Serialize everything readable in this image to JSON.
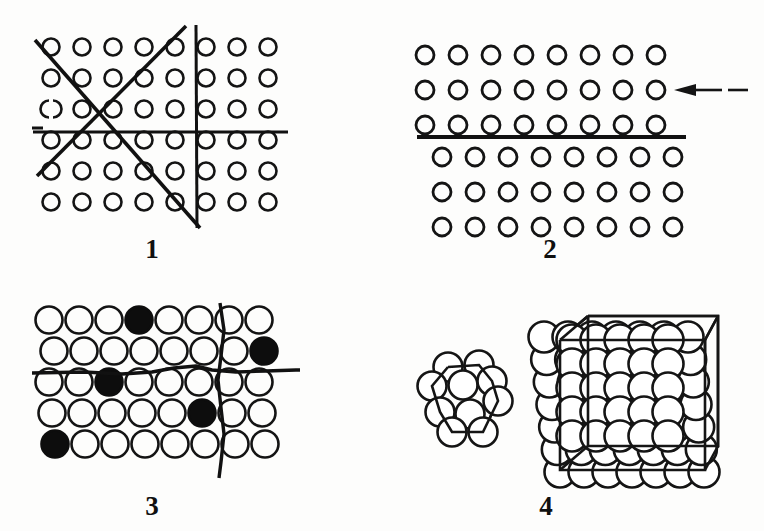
{
  "figure": {
    "background_color": "#fdfdfc",
    "ink_color": "#141414",
    "panels": [
      {
        "id": "panel-1",
        "caption": "1",
        "caption_x": 152,
        "caption_y": 236,
        "description": "Square lattice of open circles crossed by horizontal, vertical and two diagonal slip lines",
        "lattice": {
          "type": "square-open",
          "rows": 6,
          "cols": 8,
          "origin_x": 51,
          "origin_y": 47,
          "dx": 31,
          "dy": 31,
          "radius": 8.5,
          "stroke_width": 2.6,
          "broken_circle": {
            "row": 2,
            "col": 0
          }
        },
        "lines": [
          {
            "name": "horizontal-glide-line",
            "x1": 33,
            "y1": 132,
            "x2": 288,
            "y2": 132,
            "width": 3.0
          },
          {
            "name": "vertical-glide-line",
            "x1": 196,
            "y1": 25,
            "x2": 197,
            "y2": 228,
            "width": 3.0
          },
          {
            "name": "diagonal-line-down-right",
            "x1": 35,
            "y1": 40,
            "x2": 200,
            "y2": 228,
            "width": 3.6
          },
          {
            "name": "diagonal-line-up-right",
            "x1": 37,
            "y1": 176,
            "x2": 186,
            "y2": 26,
            "width": 3.6
          },
          {
            "name": "left-dash-mark",
            "x1": 32,
            "y1": 128,
            "x2": 43,
            "y2": 128,
            "width": 3.0
          }
        ]
      },
      {
        "id": "panel-2",
        "caption": "2",
        "caption_x": 550,
        "caption_y": 236,
        "description": "Slip step: upper three rows of circles displaced relative to lower three rows across a slip plane, with a leftward shear arrow",
        "lattice": {
          "type": "square-open-offset",
          "rows_upper": 3,
          "rows_lower": 3,
          "cols": 8,
          "origin_x": 425,
          "origin_y": 55,
          "dx": 33,
          "dy": 35,
          "lower_offset_x": 17,
          "lower_start_y": 157,
          "radius": 9,
          "stroke_width": 2.8
        },
        "lines": [
          {
            "name": "slip-plane-line",
            "x1": 417,
            "y1": 137,
            "x2": 686,
            "y2": 137,
            "width": 3.8
          }
        ],
        "arrow": {
          "name": "shear-arrow",
          "direction": "left",
          "tip_x": 674,
          "tail_x": 748,
          "y": 90,
          "head_length": 22,
          "head_half_height": 6
        }
      },
      {
        "id": "panel-3",
        "caption": "3",
        "caption_x": 152,
        "caption_y": 493,
        "description": "Close packed lattice with five substitutional impurity atoms (filled circles) and two irregular wavy grain boundary lines",
        "lattice": {
          "type": "close-packed-open",
          "rows": 5,
          "cols": 8,
          "origin_x": 49,
          "origin_y": 320,
          "dx": 30,
          "dy": 31,
          "radius": 13.5,
          "stroke_width": 2.6,
          "row_offsets": [
            0,
            5,
            0,
            3,
            6
          ],
          "filled_cells": [
            {
              "row": 0,
              "col": 3
            },
            {
              "row": 1,
              "col": 7
            },
            {
              "row": 2,
              "col": 2
            },
            {
              "row": 3,
              "col": 5
            },
            {
              "row": 4,
              "col": 0
            }
          ]
        },
        "lines": [
          {
            "name": "wavy-horizontal-boundary",
            "points": "32,373 84,372 122,374 152,372 174,368 196,366 212,370 236,372 266,371 296,370 300,370",
            "width": 3.4
          },
          {
            "name": "wavy-vertical-boundary",
            "points": "220,303 224,330 221,356 218,380 221,408 224,434 221,462 219,478",
            "width": 3.4
          }
        ]
      },
      {
        "id": "panel-4",
        "caption": "4",
        "caption_x": 546,
        "caption_y": 493,
        "description": "Close packed hard sphere models: small nine atom cluster at left and a large crystallite at right, both outlined by a cubic unit cell frame",
        "small_cluster": {
          "name": "small-atom-cluster",
          "center_x": 465,
          "center_y": 395,
          "radius": 14.5,
          "stroke_width": 2.6,
          "atoms": [
            [
              448,
              367
            ],
            [
              479,
              365
            ],
            [
              432,
              386
            ],
            [
              463,
              385
            ],
            [
              492,
              381
            ],
            [
              440,
              412
            ],
            [
              470,
              414
            ],
            [
              498,
              401
            ],
            [
              452,
              432
            ],
            [
              483,
              432
            ]
          ],
          "frame": "448,367 479,365 492,381 498,401 483,432 452,432 440,412 432,386 448,367"
        },
        "large_cluster": {
          "name": "large-atom-crystallite",
          "radius": 15.5,
          "stroke_width": 2.6,
          "grid_rows": 7,
          "grid_cols": 7,
          "origin_x": 560,
          "origin_y": 328,
          "dx": 24,
          "dy": 24,
          "shear_x": -8,
          "frame_outer": "560,340 705,340 705,470 560,470 560,340",
          "frame_inner": "588,316 718,316 718,446 588,446 588,316",
          "frame_edges": [
            "560,340 588,316",
            "705,340 718,316",
            "705,470 718,446",
            "560,470 588,446"
          ]
        }
      }
    ]
  }
}
